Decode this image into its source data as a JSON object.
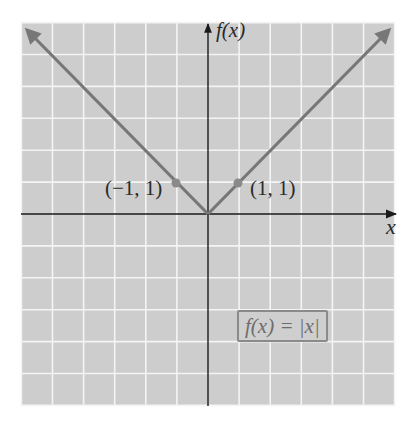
{
  "chart_data": {
    "type": "line",
    "title": "",
    "function": "f(x) = |x|",
    "xlabel": "x",
    "ylabel": "f(x)",
    "xlim": [
      -6,
      6
    ],
    "ylim": [
      -6,
      6
    ],
    "grid": true,
    "series": [
      {
        "name": "f(x) = |x|",
        "x": [
          -6,
          -1,
          0,
          1,
          6
        ],
        "y": [
          6,
          1,
          0,
          1,
          6
        ]
      }
    ],
    "points": [
      {
        "x": -1,
        "y": 1,
        "label": "(−1, 1)"
      },
      {
        "x": 1,
        "y": 1,
        "label": "(1, 1)"
      }
    ],
    "annotations": [
      "f(x) = |x|"
    ]
  },
  "labels": {
    "y_axis": "f(x)",
    "x_axis": "x",
    "point_left": "(−1, 1)",
    "point_right": "(1, 1)",
    "equation": "f(x) = |x|"
  },
  "colors": {
    "grid_bg": "#cdcdcd",
    "grid_lines": "#f4f4f4",
    "axes": "#1a1a1a",
    "curve": "#777777",
    "points": "#8a8a8a"
  }
}
